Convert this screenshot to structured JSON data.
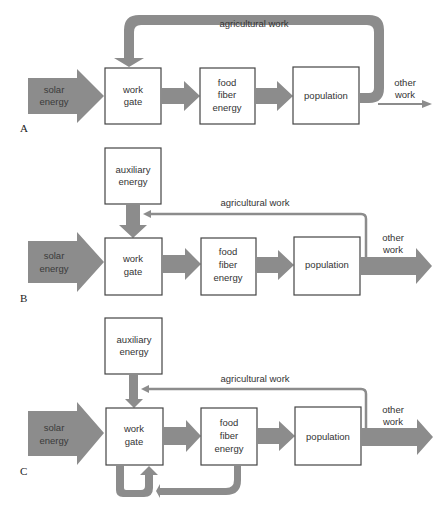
{
  "colors": {
    "flow": "#8c8c8c",
    "box_stroke": "#444444",
    "background": "#ffffff"
  },
  "panels": [
    {
      "letter": "A",
      "solar": [
        "solar",
        "energy"
      ],
      "work_gate": [
        "work",
        "gate"
      ],
      "food": [
        "food",
        "fiber",
        "energy"
      ],
      "population": "population",
      "feedback": "agricultural work",
      "other": [
        "other",
        "work"
      ]
    },
    {
      "letter": "B",
      "auxiliary": [
        "auxiliary",
        "energy"
      ],
      "solar": [
        "solar",
        "energy"
      ],
      "work_gate": [
        "work",
        "gate"
      ],
      "food": [
        "food",
        "fiber",
        "energy"
      ],
      "population": "population",
      "feedback": "agricultural work",
      "other": [
        "other",
        "work"
      ]
    },
    {
      "letter": "C",
      "auxiliary": [
        "auxiliary",
        "energy"
      ],
      "solar": [
        "solar",
        "energy"
      ],
      "work_gate": [
        "work",
        "gate"
      ],
      "food": [
        "food",
        "fiber",
        "energy"
      ],
      "population": "population",
      "feedback": "agricultural work",
      "other": [
        "other",
        "work"
      ]
    }
  ]
}
